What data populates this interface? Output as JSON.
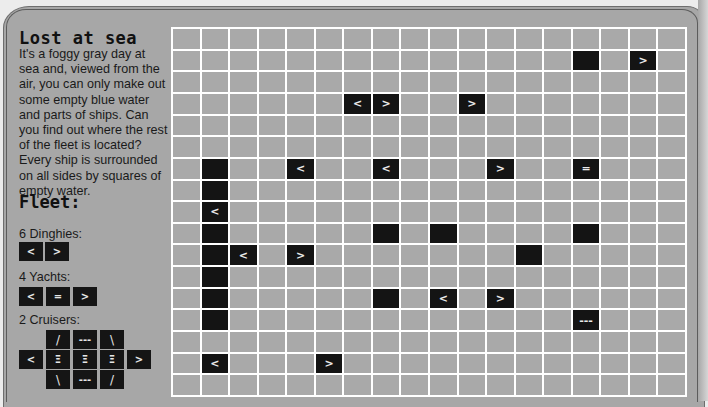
{
  "title": "Lost at sea",
  "intro": "It's a foggy gray day at sea and, viewed from the air, you can only make out some empty blue water and parts of ships. Can you find out where the rest of the fleet is located? Every ship is surrounded on all sides by squares of empty water.",
  "fleet": {
    "title": "Fleet:",
    "dinghies": {
      "label": "6 Dinghies:",
      "cells": [
        "<",
        ">"
      ]
    },
    "yachts": {
      "label": "4 Yachts:",
      "cells": [
        "<",
        "=",
        ">"
      ]
    },
    "cruisers": {
      "label": "2 Cruisers:",
      "rows": [
        [
          "",
          "/",
          "---",
          "\\",
          ""
        ],
        [
          "<",
          "Ξ",
          "Ξ",
          "Ξ",
          ">"
        ],
        [
          "",
          "\\",
          "---",
          "/",
          ""
        ]
      ]
    }
  },
  "grid": {
    "rows": 17,
    "cols": 18,
    "colors": {
      "water": "#a9a9a9",
      "ship": "#141414",
      "lines": "#ffffff"
    },
    "ship_cells": [
      {
        "r": 1,
        "c": 14,
        "glyph": ""
      },
      {
        "r": 1,
        "c": 16,
        "glyph": ">"
      },
      {
        "r": 3,
        "c": 6,
        "glyph": "<"
      },
      {
        "r": 3,
        "c": 7,
        "glyph": ">"
      },
      {
        "r": 3,
        "c": 10,
        "glyph": ">"
      },
      {
        "r": 6,
        "c": 1,
        "glyph": ""
      },
      {
        "r": 6,
        "c": 4,
        "glyph": "<"
      },
      {
        "r": 6,
        "c": 7,
        "glyph": "<"
      },
      {
        "r": 6,
        "c": 11,
        "glyph": ">"
      },
      {
        "r": 6,
        "c": 14,
        "glyph": "="
      },
      {
        "r": 7,
        "c": 1,
        "glyph": ""
      },
      {
        "r": 8,
        "c": 1,
        "glyph": "<"
      },
      {
        "r": 9,
        "c": 1,
        "glyph": ""
      },
      {
        "r": 9,
        "c": 7,
        "glyph": ""
      },
      {
        "r": 9,
        "c": 9,
        "glyph": ""
      },
      {
        "r": 9,
        "c": 14,
        "glyph": ""
      },
      {
        "r": 10,
        "c": 1,
        "glyph": ""
      },
      {
        "r": 10,
        "c": 2,
        "glyph": "<"
      },
      {
        "r": 10,
        "c": 4,
        "glyph": ">"
      },
      {
        "r": 10,
        "c": 12,
        "glyph": ""
      },
      {
        "r": 11,
        "c": 1,
        "glyph": ""
      },
      {
        "r": 12,
        "c": 1,
        "glyph": ""
      },
      {
        "r": 12,
        "c": 7,
        "glyph": ""
      },
      {
        "r": 12,
        "c": 9,
        "glyph": "<"
      },
      {
        "r": 12,
        "c": 11,
        "glyph": ">"
      },
      {
        "r": 13,
        "c": 1,
        "glyph": ""
      },
      {
        "r": 13,
        "c": 14,
        "glyph": "---"
      },
      {
        "r": 15,
        "c": 1,
        "glyph": "<"
      },
      {
        "r": 15,
        "c": 5,
        "glyph": ">"
      }
    ]
  }
}
